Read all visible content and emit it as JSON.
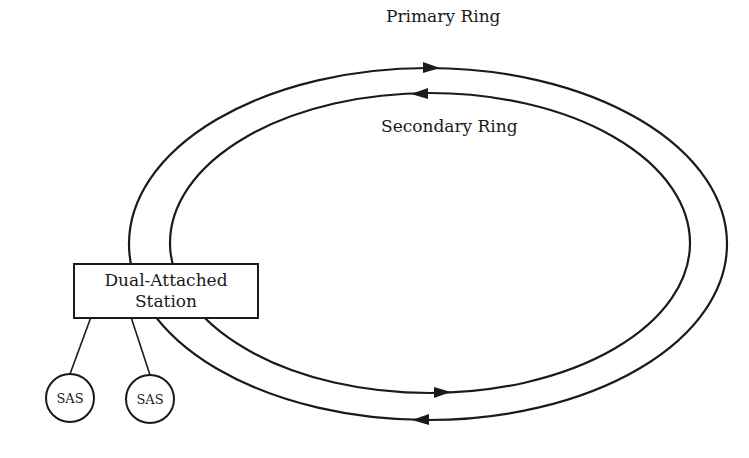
{
  "diagram": {
    "type": "FDDI dual ring topology",
    "rings": [
      {
        "name": "primary",
        "label": "Primary Ring",
        "direction": "clockwise (top arrow points right, bottom arrow points right)"
      },
      {
        "name": "secondary",
        "label": "Secondary Ring",
        "direction": "counter-clockwise (top arrow points left, bottom arrow points left)"
      }
    ],
    "station": {
      "line1": "Dual-Attached",
      "line2": "Station"
    },
    "single_attached_stations": [
      {
        "label": "SAS"
      },
      {
        "label": "SAS"
      }
    ],
    "colors": {
      "stroke": "#1a1a1a",
      "background": "#ffffff"
    }
  }
}
